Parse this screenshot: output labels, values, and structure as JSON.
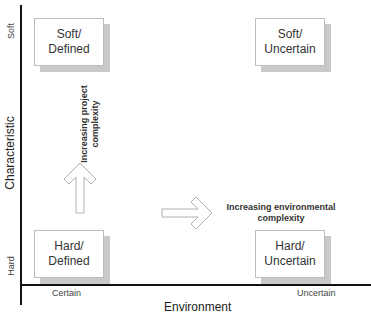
{
  "diagram": {
    "type": "2x2 matrix",
    "axes": {
      "y": {
        "title": "Characteristic",
        "ticks": {
          "top": "Soft",
          "bottom": "Hard"
        }
      },
      "x": {
        "title": "Environment",
        "ticks": {
          "left": "Certain",
          "right": "Uncertain"
        }
      }
    },
    "quadrants": {
      "top_left": "Soft/\nDefined",
      "top_right": "Soft/\nUncertain",
      "bottom_left": "Hard/\nDefined",
      "bottom_right": "Hard/\nUncertain"
    },
    "annotations": {
      "vertical": "Increasing project\ncomplexity",
      "horizontal": "Increasing environmental\ncomplexity"
    },
    "arrows": {
      "up": "up-arrow-outline",
      "right": "right-arrow-outline"
    },
    "colors": {
      "axis": "#111111",
      "box_border": "#bdbdbd",
      "box_shadow": "#c9c9c9",
      "arrow_stroke": "#b0b0b0"
    }
  }
}
